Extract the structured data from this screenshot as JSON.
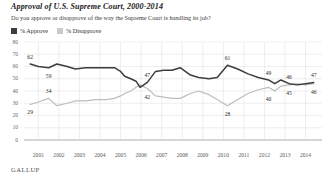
{
  "header": {
    "title": "Approval of U.S. Supreme Court, 2000-2014",
    "subtitle": "Do you approve or disapprove of the way the Supreme Court is handling its job?"
  },
  "legend": {
    "items": [
      {
        "label": "% Approve",
        "color": "#3d3d3d",
        "key": "approve"
      },
      {
        "label": "% Disapprove",
        "color": "#c9c9c9",
        "key": "disapprove"
      }
    ]
  },
  "source": {
    "label": "GALLUP"
  },
  "chart_data": {
    "type": "line",
    "title": "Approval of U.S. Supreme Court, 2000-2014",
    "subtitle": "Do you approve or disapprove of the way the Supreme Court is handling its job?",
    "xlabel": "",
    "ylabel": "",
    "ylim": [
      0,
      80
    ],
    "yticks": [
      80,
      70,
      60,
      50,
      40,
      30,
      20,
      10,
      0
    ],
    "grid": true,
    "legend_position": "top-left",
    "xticks": [
      "2001",
      "2002",
      "2003",
      "2004",
      "2005",
      "2006",
      "2007",
      "2008",
      "2009",
      "2010",
      "2011",
      "2012",
      "2013",
      "2014"
    ],
    "x": [
      2000.6,
      2001.0,
      2001.5,
      2001.9,
      2002.4,
      2002.8,
      2003.3,
      2003.8,
      2004.3,
      2004.7,
      2005.0,
      2005.2,
      2005.5,
      2005.75,
      2005.95,
      2006.3,
      2006.7,
      2007.1,
      2007.5,
      2007.9,
      2008.4,
      2008.8,
      2009.3,
      2009.7,
      2010.2,
      2010.7,
      2011.2,
      2011.7,
      2012.2,
      2012.5,
      2012.8,
      2013.2,
      2013.6,
      2014.0,
      2014.4
    ],
    "series": [
      {
        "name": "% Approve",
        "color": "#3d3d3d",
        "values": [
          62,
          60,
          59,
          62,
          60,
          58,
          59,
          59,
          59,
          59,
          56,
          52,
          50,
          48,
          43,
          47,
          56,
          57,
          57,
          59,
          53,
          51,
          50,
          51,
          61,
          58,
          54,
          51,
          49,
          46,
          49,
          46,
          45,
          46,
          47
        ]
      },
      {
        "name": "% Disapprove",
        "color": "#bdbdbd",
        "values": [
          29,
          31,
          34,
          28,
          30,
          32,
          32,
          33,
          33,
          34,
          36,
          38,
          40,
          43,
          45,
          42,
          36,
          35,
          34,
          34,
          38,
          40,
          37,
          33,
          28,
          33,
          38,
          41,
          43,
          40,
          44,
          45,
          46,
          45,
          46
        ]
      }
    ],
    "annotations": [
      {
        "text": "62",
        "x": 2000.6,
        "value": 62,
        "series": "% Approve",
        "position": "above"
      },
      {
        "text": "59",
        "x": 2001.5,
        "value": 59,
        "series": "% Approve",
        "position": "below"
      },
      {
        "text": "47",
        "x": 2006.3,
        "value": 47,
        "series": "% Approve",
        "position": "above"
      },
      {
        "text": "61",
        "x": 2010.2,
        "value": 61,
        "series": "% Approve",
        "position": "above"
      },
      {
        "text": "49",
        "x": 2012.2,
        "value": 49,
        "series": "% Approve",
        "position": "above"
      },
      {
        "text": "46",
        "x": 2013.2,
        "value": 46,
        "series": "% Approve",
        "position": "above"
      },
      {
        "text": "47",
        "x": 2014.4,
        "value": 47,
        "series": "% Approve",
        "position": "above"
      },
      {
        "text": "29",
        "x": 2000.6,
        "value": 29,
        "series": "% Disapprove",
        "position": "below"
      },
      {
        "text": "34",
        "x": 2001.5,
        "value": 34,
        "series": "% Disapprove",
        "position": "above"
      },
      {
        "text": "42",
        "x": 2006.3,
        "value": 42,
        "series": "% Disapprove",
        "position": "below"
      },
      {
        "text": "28",
        "x": 2010.2,
        "value": 28,
        "series": "% Disapprove",
        "position": "below"
      },
      {
        "text": "40",
        "x": 2012.2,
        "value": 40,
        "series": "% Disapprove",
        "position": "below"
      },
      {
        "text": "45",
        "x": 2013.2,
        "value": 45,
        "series": "% Disapprove",
        "position": "below"
      },
      {
        "text": "46",
        "x": 2014.4,
        "value": 46,
        "series": "% Disapprove",
        "position": "below"
      }
    ]
  }
}
